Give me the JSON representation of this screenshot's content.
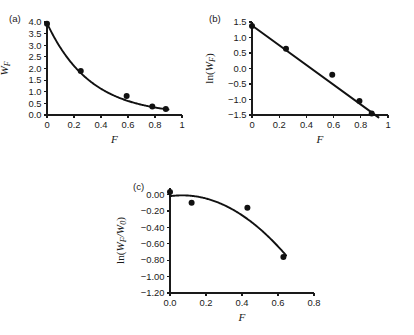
{
  "figure": {
    "background": "#ffffff",
    "ink_color": "#111111"
  },
  "chart_data": [
    {
      "id": "a",
      "panel_label": "(a)",
      "type": "scatter",
      "title": "",
      "xlabel": "F",
      "ylabel": "W_F",
      "ylabel_display": "W",
      "ylabel_sub": "F",
      "xlim": [
        0,
        1
      ],
      "ylim": [
        0,
        4.0
      ],
      "xticks": [
        0,
        0.2,
        0.4,
        0.6,
        0.8,
        1
      ],
      "xticklabels": [
        "0",
        "0.2",
        "0.4",
        "0.6",
        "0.8",
        "1"
      ],
      "yticks": [
        0.0,
        0.5,
        1.0,
        1.5,
        2.0,
        2.5,
        3.0,
        3.5,
        4.0
      ],
      "yticklabels": [
        "0.0",
        "0.5",
        "1.0",
        "1.5",
        "2.0",
        "2.5",
        "3.0",
        "3.5",
        "4.0"
      ],
      "grid": false,
      "legend": "none",
      "x": [
        0.0,
        0.25,
        0.59,
        0.78,
        0.88
      ],
      "values": [
        3.93,
        1.89,
        0.82,
        0.37,
        0.26
      ],
      "fit_curve": {
        "kind": "exponential-decay",
        "description": "W_F = 3.95 * exp(-3.13 F)",
        "amplitude": 3.95,
        "rate": 3.13
      }
    },
    {
      "id": "b",
      "panel_label": "(b)",
      "type": "scatter",
      "title": "",
      "xlabel": "F",
      "ylabel": "ln(W_F)",
      "ylabel_prefix": "ln(",
      "ylabel_main": "W",
      "ylabel_sub": "F",
      "ylabel_suffix": ")",
      "xlim": [
        0,
        1
      ],
      "ylim": [
        -1.5,
        1.5
      ],
      "xticks": [
        0,
        0.2,
        0.4,
        0.6,
        0.8,
        1
      ],
      "xticklabels": [
        "0",
        "0.2",
        "0.4",
        "0.6",
        "0.8",
        "1"
      ],
      "yticks": [
        -1.5,
        -1.0,
        -0.5,
        0.0,
        0.5,
        1.0,
        1.5
      ],
      "yticklabels": [
        "−1.5",
        "−1.0",
        "−0.5",
        "0.0",
        "0.5",
        "1.0",
        "1.5"
      ],
      "grid": false,
      "legend": "none",
      "x": [
        0.0,
        0.25,
        0.59,
        0.79,
        0.88
      ],
      "values": [
        1.37,
        0.64,
        -0.2,
        -1.05,
        -1.45
      ],
      "fit_curve": {
        "kind": "linear",
        "description": "ln(W_F) = 1.39 - 3.19 F",
        "intercept": 1.39,
        "slope": -3.19,
        "x_start": 0.0,
        "x_end": 0.93
      }
    },
    {
      "id": "c",
      "panel_label": "(c)",
      "type": "scatter",
      "title": "",
      "xlabel": "F",
      "ylabel": "ln(W_F/W_0)",
      "ylabel_prefix": "ln(",
      "ylabel_main": "W",
      "ylabel_sub": "F",
      "ylabel_mid": "/W",
      "ylabel_sub2": "0",
      "ylabel_suffix": ")",
      "xlim": [
        0,
        0.8
      ],
      "ylim": [
        -1.2,
        0.08
      ],
      "xticks": [
        0.0,
        0.2,
        0.4,
        0.6,
        0.8
      ],
      "xticklabels": [
        "0.0",
        "0.2",
        "0.4",
        "0.6",
        "0.8"
      ],
      "yticks": [
        -1.2,
        -1.0,
        -0.8,
        -0.6,
        -0.4,
        -0.2,
        0.0
      ],
      "yticklabels": [
        "−1.20",
        "−1.00",
        "−0.80",
        "−0.60",
        "−0.40",
        "−0.20",
        "0.00"
      ],
      "grid": false,
      "legend": "none",
      "x": [
        0.0,
        0.12,
        0.43,
        0.63
      ],
      "values": [
        0.03,
        -0.1,
        -0.16,
        -0.76
      ],
      "fit_curve": {
        "kind": "quadratic",
        "description": "ln(W_F/W_0) = -0.02 + 0.30 F - 2.20 F^2",
        "c0": -0.02,
        "c1": 0.3,
        "c2": -2.2
      }
    }
  ]
}
